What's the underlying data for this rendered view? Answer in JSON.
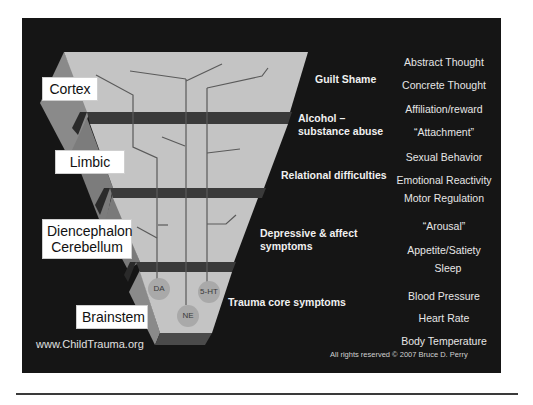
{
  "diagram": {
    "regions": [
      {
        "label": "Cortex"
      },
      {
        "label": "Limbic"
      },
      {
        "label": "Diencephalon\nCerebellum",
        "line1": "Diencephalon",
        "line2": "Cerebellum"
      },
      {
        "label": "Brainstem"
      }
    ],
    "symptoms": [
      {
        "text": "Guilt Shame"
      },
      {
        "line1": "Alcohol –",
        "line2": "substance abuse"
      },
      {
        "text": "Relational difficulties"
      },
      {
        "line1": "Depressive & affect",
        "line2": "symptoms"
      },
      {
        "text": "Trauma core symptoms"
      }
    ],
    "functions": [
      "Abstract Thought",
      "Concrete Thought",
      "Affiliation/reward",
      "“Attachment”",
      "Sexual Behavior",
      "Emotional Reactivity",
      "Motor Regulation",
      "“Arousal”",
      "Appetite/Satiety",
      "Sleep",
      "Blood Pressure",
      "Heart Rate",
      "Body Temperature"
    ],
    "neurotransmitters": [
      "DA",
      "5-HT",
      "NE"
    ],
    "footer": {
      "url": "www.ChildTrauma.org",
      "copyright": "All rights reserved © 2007 Bruce D. Perry"
    },
    "colors": {
      "background": "#151515",
      "layer_face": "#c4c4c4",
      "layer_side": "#8a8a8a",
      "separator": "#3a3a3a",
      "neuron_line": "#5a5a5a",
      "label_bg": "#ffffff"
    }
  }
}
